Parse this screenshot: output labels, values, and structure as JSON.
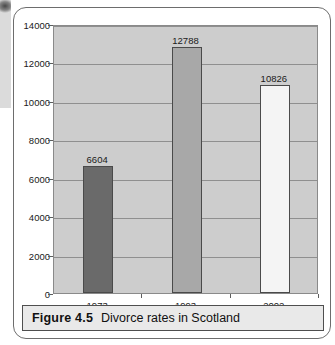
{
  "figure": {
    "caption_label": "Figure 4.5",
    "caption_text": "Divorce rates in Scotland"
  },
  "chart_data": {
    "type": "bar",
    "title": "Divorce rates in Scotland",
    "xlabel": "",
    "ylabel": "",
    "categories": [
      "1973",
      "1993",
      "2002"
    ],
    "values": [
      6604,
      12788,
      10826
    ],
    "value_labels": [
      "6604",
      "12788",
      "10826"
    ],
    "ylim": [
      0,
      14000
    ],
    "ytick_labels": [
      "0",
      "2000",
      "4000",
      "6000",
      "8000",
      "10000",
      "12000",
      "14000"
    ],
    "yticks": [
      0,
      2000,
      4000,
      6000,
      8000,
      10000,
      12000,
      14000
    ],
    "grid": true,
    "legend": false,
    "plot_background": "#cdcdcd",
    "bar_colors": [
      "#6a6a6a",
      "#a8a8a8",
      "#f4f4f4"
    ],
    "bar_border_color": "#4a4a4a"
  }
}
